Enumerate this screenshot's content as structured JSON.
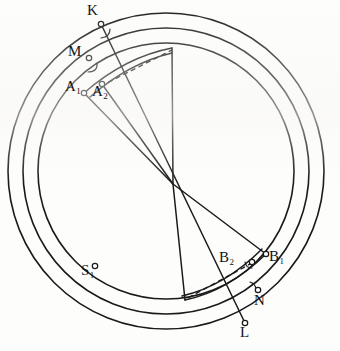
{
  "figure": {
    "kind": "geometric-line-diagram",
    "width": 340,
    "height": 351,
    "background_color": "#fdfdfc",
    "ink_color": "#1a1a1a"
  },
  "geometry": {
    "circle_center": {
      "x": 166,
      "y": 171
    },
    "ray_origin": {
      "x": 173,
      "y": 184
    },
    "circles": [
      {
        "name": "outer-circle",
        "r": 158,
        "stroke_width": 1.5
      },
      {
        "name": "middle-circle",
        "r": 143,
        "stroke_width": 1.5
      },
      {
        "name": "inner-circle",
        "r": 128,
        "stroke_width": 1.5
      }
    ],
    "secant_line": {
      "name": "line-K-L",
      "from": "K",
      "to": "L"
    },
    "rays": [
      {
        "name": "ray-to-A1",
        "to": {
          "x": 86,
          "y": 92
        }
      },
      {
        "name": "ray-to-A2",
        "to": {
          "x": 101,
          "y": 84
        }
      },
      {
        "name": "ray-to-arc-top",
        "to": {
          "x": 172,
          "y": 48
        }
      },
      {
        "name": "ray-to-B1",
        "to": {
          "x": 266,
          "y": 254
        }
      },
      {
        "name": "ray-to-arc-bottom",
        "to": {
          "x": 185,
          "y": 300
        }
      }
    ],
    "chord_arcs": [
      {
        "name": "upper-chord-arc",
        "from": {
          "x": 86,
          "y": 92
        },
        "to": {
          "x": 172,
          "y": 48
        }
      },
      {
        "name": "lower-chord-arc",
        "from": {
          "x": 266,
          "y": 254
        },
        "to": {
          "x": 185,
          "y": 300
        }
      }
    ],
    "dashed_lines": [
      {
        "name": "dashed-A2-to-arc-top",
        "from": {
          "x": 101,
          "y": 84
        },
        "to": {
          "x": 172,
          "y": 49
        }
      },
      {
        "name": "dashed-B2-to-arc-bottom",
        "from": {
          "x": 252,
          "y": 262
        },
        "to": {
          "x": 186,
          "y": 299
        }
      }
    ]
  },
  "points": [
    {
      "id": "K",
      "label": "K",
      "sub": "",
      "marker": {
        "x": 101,
        "y": 24
      },
      "label_pos": {
        "x": 87,
        "y": 3
      },
      "on": "outer-circle"
    },
    {
      "id": "M",
      "label": "M",
      "sub": "",
      "marker": {
        "x": 89,
        "y": 58
      },
      "label_pos": {
        "x": 68,
        "y": 44
      },
      "on": "middle-circle"
    },
    {
      "id": "A1",
      "label": "A",
      "sub": "1",
      "marker": {
        "x": 84,
        "y": 93
      },
      "label_pos": {
        "x": 65,
        "y": 79
      },
      "on": "inner-circle"
    },
    {
      "id": "A2",
      "label": "A",
      "sub": "2",
      "marker": {
        "x": 102,
        "y": 84
      },
      "label_pos": {
        "x": 92,
        "y": 84
      },
      "on": "inner-circle"
    },
    {
      "id": "S1",
      "label": "S",
      "sub": "1",
      "marker": {
        "x": 95,
        "y": 266
      },
      "label_pos": {
        "x": 81,
        "y": 263
      },
      "on": "middle-circle"
    },
    {
      "id": "B2",
      "label": "B",
      "sub": "2",
      "marker": {
        "x": 252,
        "y": 262
      },
      "label_pos": {
        "x": 219,
        "y": 250
      },
      "on": "inner-circle"
    },
    {
      "id": "B1",
      "label": "B",
      "sub": "1",
      "marker": {
        "x": 266,
        "y": 254
      },
      "label_pos": {
        "x": 264,
        "y": 249
      },
      "on": "inner-circle"
    },
    {
      "id": "N",
      "label": "N",
      "sub": "",
      "marker": {
        "x": 258,
        "y": 290
      },
      "label_pos": {
        "x": 254,
        "y": 293
      },
      "on": "middle-circle"
    },
    {
      "id": "L",
      "label": "L",
      "sub": "",
      "marker": {
        "x": 245,
        "y": 323
      },
      "label_pos": {
        "x": 240,
        "y": 325
      },
      "on": "outer-circle"
    }
  ],
  "angle_marks": [
    {
      "name": "angle-mark-at-K",
      "at": {
        "x": 105,
        "y": 32
      }
    },
    {
      "name": "angle-mark-at-M",
      "at": {
        "x": 94,
        "y": 66
      }
    },
    {
      "name": "angle-mark-at-B",
      "at": {
        "x": 248,
        "y": 265
      }
    },
    {
      "name": "angle-mark-at-N",
      "at": {
        "x": 255,
        "y": 284
      }
    }
  ]
}
